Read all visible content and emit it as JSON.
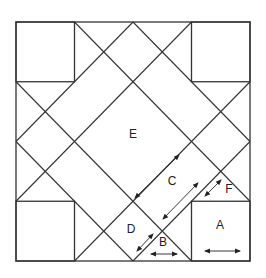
{
  "diagram": {
    "type": "quilt-block",
    "colors": {
      "line": "#333333",
      "background": "#ffffff"
    },
    "pieces": [
      {
        "label": "A"
      },
      {
        "label": "B"
      },
      {
        "label": "C"
      },
      {
        "label": "D"
      },
      {
        "label": "E"
      },
      {
        "label": "F"
      }
    ],
    "grain_arrows": [
      {
        "piece": "E",
        "direction": "diagonal"
      },
      {
        "piece": "C",
        "direction": "diagonal"
      },
      {
        "piece": "F",
        "direction": "diagonal"
      },
      {
        "piece": "D",
        "direction": "diagonal"
      },
      {
        "piece": "B",
        "direction": "horizontal"
      },
      {
        "piece": "A",
        "direction": "horizontal"
      }
    ]
  }
}
